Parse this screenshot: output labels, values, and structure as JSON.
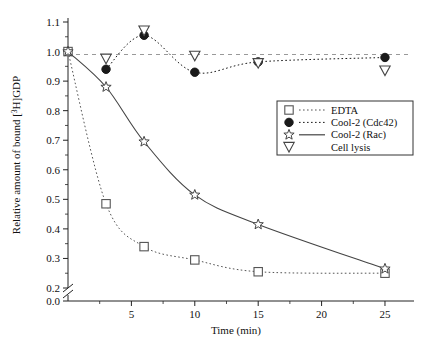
{
  "chart_data": {
    "type": "line",
    "title": "",
    "xlabel": "Time (min)",
    "ylabel": "Relative amount of bound [3H]GDP",
    "ylabel_parts": {
      "pre": "Relative amount of bound [",
      "sup": "3",
      "post": "H]GDP"
    },
    "xlim": [
      0,
      26.5
    ],
    "ylim": [
      0.2,
      1.15
    ],
    "y_broken_axis": true,
    "y_break_between": [
      0.0,
      0.2
    ],
    "grid": false,
    "legend_position": "right-middle",
    "xticks": [
      5,
      10,
      15,
      20,
      25
    ],
    "xtick_labels": [
      "5",
      "10",
      "15",
      "20",
      "25"
    ],
    "x_minor_ticks": [
      2.5,
      7.5,
      12.5,
      17.5,
      22.5
    ],
    "yticks": [
      0.0,
      0.2,
      0.3,
      0.4,
      0.5,
      0.6,
      0.7,
      0.8,
      0.9,
      1.0,
      1.1
    ],
    "ytick_labels": [
      "0.0",
      "0.2",
      "0.3",
      "0.4",
      "0.5",
      "0.6",
      "0.7",
      "0.8",
      "0.9",
      "1.0",
      "1.1"
    ],
    "y_minor_ticks": [
      0.25,
      0.35,
      0.45,
      0.55,
      0.65,
      0.75,
      0.85,
      0.95,
      1.05
    ],
    "reference_line": {
      "y": 0.99,
      "style": "dashed",
      "color": "#999999"
    },
    "series": [
      {
        "name": "EDTA",
        "marker": "open-square",
        "line_style": "dotted",
        "color": "#555555",
        "x": [
          0,
          3,
          6,
          10,
          15,
          25
        ],
        "y": [
          1.0,
          0.485,
          0.34,
          0.295,
          0.255,
          0.25
        ]
      },
      {
        "name": "Cool-2 (Cdc42)",
        "marker": "filled-circle",
        "line_style": "dotted",
        "color": "#1a1a1a",
        "x": [
          3,
          6,
          10,
          15,
          25
        ],
        "y": [
          0.94,
          1.055,
          0.93,
          0.965,
          0.98
        ]
      },
      {
        "name": "Cool-2 (Rac)",
        "marker": "open-star",
        "line_style": "solid",
        "color": "#444444",
        "x": [
          0,
          3,
          6,
          10,
          15,
          25
        ],
        "y": [
          1.0,
          0.88,
          0.695,
          0.515,
          0.415,
          0.265
        ]
      },
      {
        "name": "Cell lysis",
        "marker": "open-triangle-down",
        "line_style": "none",
        "color": "#444444",
        "x": [
          3,
          6,
          10,
          15,
          25
        ],
        "y": [
          0.975,
          1.07,
          0.985,
          0.96,
          0.935
        ]
      }
    ]
  },
  "legend": {
    "entries": [
      {
        "label": "EDTA",
        "marker": "open-square",
        "line": "dotted"
      },
      {
        "label": "Cool-2 (Cdc42)",
        "marker": "filled-circle",
        "line": "dotted"
      },
      {
        "label": "Cool-2 (Rac)",
        "marker": "open-star",
        "line": "solid"
      },
      {
        "label": "Cell lysis",
        "marker": "open-triangle-down",
        "line": "none"
      }
    ]
  },
  "colors": {
    "axis": "#222222",
    "reference": "#999999",
    "edta": "#555555",
    "cdc42": "#1a1a1a",
    "rac": "#444444",
    "lysis": "#444444",
    "background": "#ffffff"
  }
}
